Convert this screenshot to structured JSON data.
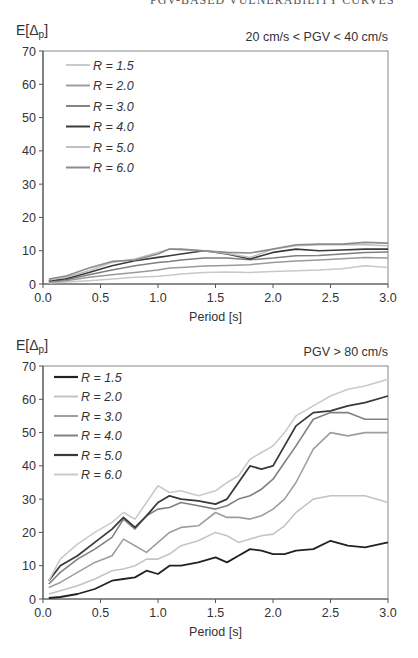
{
  "page": {
    "running_head": "PGV-BASED VULNERABILITY CURVES"
  },
  "chart_data": [
    {
      "type": "line",
      "title": "20 cm/s < PGV < 40 cm/s",
      "ylabel": "E[Δp]",
      "xlabel": "Period [s]",
      "xlim": [
        0.0,
        3.0
      ],
      "ylim": [
        0,
        70
      ],
      "xticks": [
        "0.0",
        "0.5",
        "1.0",
        "1.5",
        "2.0",
        "2.5",
        "3.0"
      ],
      "yticks": [
        "0",
        "10",
        "20",
        "30",
        "40",
        "50",
        "60",
        "70"
      ],
      "grid": false,
      "legend_position": "upper-left",
      "x": [
        0.05,
        0.2,
        0.4,
        0.6,
        0.8,
        1.0,
        1.1,
        1.2,
        1.4,
        1.6,
        1.8,
        2.0,
        2.2,
        2.4,
        2.6,
        2.8,
        3.0
      ],
      "series": [
        {
          "name": "R = 1.5",
          "color": "#c8c8c8",
          "width": 1.5,
          "values": [
            0.3,
            0.6,
            1.0,
            1.5,
            2.0,
            2.3,
            2.6,
            3.0,
            3.5,
            3.6,
            3.5,
            3.8,
            4.0,
            4.2,
            4.6,
            5.5,
            5.0
          ]
        },
        {
          "name": "R = 2.0",
          "color": "#9a9a9a",
          "width": 1.5,
          "values": [
            0.5,
            1.0,
            2.0,
            2.8,
            3.5,
            4.2,
            4.8,
            5.0,
            5.4,
            5.6,
            5.8,
            6.5,
            6.9,
            7.2,
            7.6,
            8.0,
            7.8
          ]
        },
        {
          "name": "R = 3.0",
          "color": "#7e7e7e",
          "width": 1.5,
          "values": [
            0.8,
            1.3,
            2.8,
            4.2,
            5.5,
            6.5,
            6.8,
            7.2,
            7.8,
            7.8,
            7.3,
            7.8,
            8.5,
            8.6,
            9.0,
            9.5,
            9.6
          ]
        },
        {
          "name": "R = 4.0",
          "color": "#3a3a3a",
          "width": 1.6,
          "values": [
            1.0,
            1.6,
            3.5,
            5.5,
            7.0,
            8.0,
            8.5,
            9.0,
            10.0,
            9.0,
            7.5,
            9.5,
            10.5,
            10.0,
            10.2,
            10.5,
            10.5
          ]
        },
        {
          "name": "R = 5.0",
          "color": "#bdbdbd",
          "width": 1.5,
          "values": [
            1.2,
            2.0,
            4.0,
            6.5,
            7.5,
            9.5,
            10.5,
            10.2,
            10.0,
            9.2,
            8.0,
            10.5,
            11.5,
            11.8,
            11.8,
            11.8,
            11.5
          ]
        },
        {
          "name": "R = 6.0",
          "color": "#8c8c8c",
          "width": 1.6,
          "values": [
            1.5,
            2.4,
            4.8,
            6.8,
            7.2,
            9.0,
            10.5,
            10.5,
            10.0,
            9.5,
            9.3,
            10.5,
            11.8,
            12.0,
            12.0,
            12.5,
            12.3
          ]
        }
      ]
    },
    {
      "type": "line",
      "title": "PGV > 80 cm/s",
      "ylabel": "E[Δp]",
      "xlabel": "Period [s]",
      "xlim": [
        0.0,
        3.0
      ],
      "ylim": [
        0,
        70
      ],
      "xticks": [
        "0.0",
        "0.5",
        "1.0",
        "1.5",
        "2.0",
        "2.5",
        "3.0"
      ],
      "yticks": [
        "0",
        "10",
        "20",
        "30",
        "40",
        "50",
        "60",
        "70"
      ],
      "grid": false,
      "legend_position": "upper-left",
      "x": [
        0.05,
        0.15,
        0.3,
        0.45,
        0.6,
        0.7,
        0.8,
        0.9,
        1.0,
        1.1,
        1.2,
        1.35,
        1.5,
        1.6,
        1.7,
        1.8,
        1.9,
        2.0,
        2.1,
        2.2,
        2.35,
        2.5,
        2.65,
        2.8,
        3.0
      ],
      "series": [
        {
          "name": "R = 1.5",
          "color": "#222222",
          "width": 1.8,
          "values": [
            0.3,
            0.6,
            1.5,
            3.0,
            5.5,
            6.0,
            6.5,
            8.5,
            7.5,
            10.0,
            10.0,
            11.0,
            12.5,
            11.0,
            13.0,
            15.0,
            14.5,
            13.5,
            13.5,
            14.5,
            15.0,
            17.5,
            16.0,
            15.5,
            17.0
          ]
        },
        {
          "name": "R = 2.0",
          "color": "#c4c4c4",
          "width": 1.6,
          "values": [
            1.5,
            2.5,
            4.0,
            6.0,
            8.5,
            9.0,
            10.0,
            12.0,
            12.0,
            13.5,
            16.0,
            17.5,
            20.0,
            19.0,
            17.0,
            18.0,
            19.0,
            19.5,
            22.0,
            26.0,
            30.0,
            31.0,
            31.0,
            31.0,
            29.0
          ]
        },
        {
          "name": "R = 3.0",
          "color": "#9e9e9e",
          "width": 1.6,
          "values": [
            3.5,
            5.0,
            8.0,
            11.0,
            13.0,
            18.0,
            16.0,
            14.0,
            17.0,
            20.0,
            21.5,
            22.0,
            26.0,
            24.5,
            24.5,
            24.0,
            25.0,
            27.0,
            30.0,
            35.0,
            45.0,
            50.0,
            49.0,
            50.0,
            50.0
          ]
        },
        {
          "name": "R = 4.0",
          "color": "#808080",
          "width": 1.6,
          "values": [
            4.5,
            8.0,
            12.0,
            15.0,
            18.5,
            24.0,
            21.0,
            25.0,
            27.0,
            27.5,
            29.0,
            28.0,
            27.0,
            28.0,
            30.0,
            31.0,
            33.0,
            36.0,
            41.0,
            46.0,
            54.0,
            56.0,
            56.0,
            54.0,
            54.0
          ]
        },
        {
          "name": "R = 5.0",
          "color": "#3a3a3a",
          "width": 1.8,
          "values": [
            5.5,
            10.0,
            13.0,
            17.0,
            21.0,
            24.5,
            21.5,
            25.0,
            29.0,
            31.0,
            30.0,
            29.5,
            28.5,
            30.0,
            35.0,
            40.0,
            39.0,
            40.0,
            46.0,
            52.0,
            56.0,
            56.5,
            58.0,
            59.0,
            61.0
          ]
        },
        {
          "name": "R = 6.0",
          "color": "#cacaca",
          "width": 1.6,
          "values": [
            5.5,
            12.0,
            16.5,
            20.0,
            23.0,
            26.0,
            24.0,
            29.0,
            34.0,
            32.0,
            32.5,
            31.0,
            32.5,
            35.0,
            37.0,
            42.0,
            44.0,
            46.0,
            50.0,
            55.0,
            58.0,
            61.0,
            63.0,
            64.0,
            66.0
          ]
        }
      ]
    }
  ]
}
